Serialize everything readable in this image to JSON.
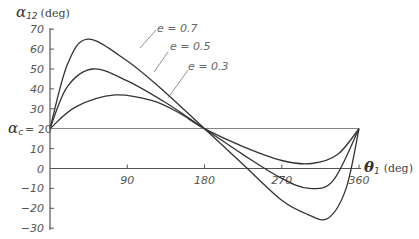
{
  "chart_data": {
    "type": "line",
    "title": "",
    "ylabel": "α12 (deg)",
    "ylabel_symbol": "α",
    "ylabel_subscript": "12",
    "ylabel_unit": "(deg)",
    "xlabel": "θ1 (deg)",
    "xlabel_symbol": "θ",
    "xlabel_subscript": "1",
    "xlabel_unit": "(deg)",
    "xlim": [
      0,
      360
    ],
    "ylim": [
      -30,
      70
    ],
    "x_ticks": [
      90,
      180,
      270,
      360
    ],
    "y_ticks": [
      70,
      60,
      50,
      40,
      30,
      20,
      10,
      0,
      -10,
      -20,
      -30
    ],
    "reference_line": {
      "label_symbol": "α",
      "label_subscript": "c",
      "label_suffix": "= 20",
      "value": 20
    },
    "grid": false,
    "series": [
      {
        "name": "e = 0.7",
        "x": [
          0,
          20,
          44,
          90,
          135,
          180,
          225,
          270,
          300,
          324,
          345,
          360
        ],
        "values": [
          20,
          52,
          65,
          54,
          38,
          20,
          2,
          -16,
          -23,
          -25,
          -10,
          20
        ]
      },
      {
        "name": "e = 0.5",
        "x": [
          0,
          20,
          50,
          90,
          135,
          180,
          225,
          270,
          302,
          330,
          360
        ],
        "values": [
          20,
          41,
          50,
          44,
          33,
          20,
          7,
          -5,
          -10,
          -6,
          20
        ]
      },
      {
        "name": "e = 0.3",
        "x": [
          0,
          30,
          76,
          120,
          150,
          180,
          225,
          270,
          305,
          335,
          360
        ],
        "values": [
          20,
          31,
          37,
          34,
          28,
          20,
          11,
          4,
          2.5,
          7,
          20
        ]
      }
    ],
    "legend": [
      "e = 0.7",
      "e = 0.5",
      "e = 0.3"
    ],
    "legend_position": "leader-lines top-center"
  },
  "labels": {
    "y_symbol": "α",
    "y_sub": "12",
    "y_unit": "(deg)",
    "x_symbol": "θ",
    "x_sub": "1",
    "x_unit": "(deg)",
    "ac_symbol": "α",
    "ac_sub": "c",
    "ac_suffix": "= 20",
    "legend_07": "e = 0.7",
    "legend_05": "e = 0.5",
    "legend_03": "e = 0.3"
  }
}
